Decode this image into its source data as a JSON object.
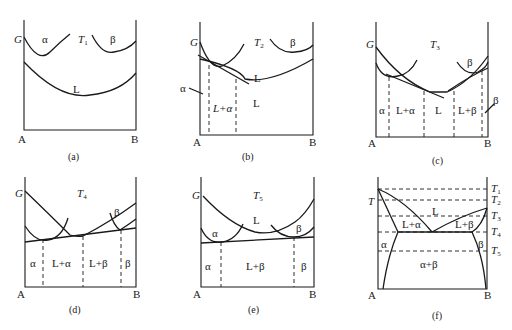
{
  "figure": {
    "colors": {
      "ink": "#1a1a1a",
      "background": "#ffffff"
    }
  },
  "panels": {
    "a": {
      "caption": "(a)",
      "axis_label": "G",
      "temp": "T",
      "temp_sub": "1",
      "left": "A",
      "right": "B",
      "curve_labels": {
        "alpha": "α",
        "beta": "β",
        "liquid": "L"
      }
    },
    "b": {
      "caption": "(b)",
      "axis_label": "G",
      "temp": "T",
      "temp_sub": "2",
      "left": "A",
      "right": "B",
      "curve_labels": {
        "beta": "β",
        "liquid": "L",
        "alpha": "α"
      },
      "regions": [
        "L+α",
        "L"
      ]
    },
    "c": {
      "caption": "(c)",
      "axis_label": "G",
      "temp": "T",
      "temp_sub": "3",
      "left": "A",
      "right": "B",
      "curve_labels": {
        "beta": "β",
        "beta_pointer": "β"
      },
      "regions": [
        "α",
        "L+α",
        "L",
        "L+β"
      ]
    },
    "d": {
      "caption": "(d)",
      "axis_label": "G",
      "temp": "T",
      "temp_sub": "4",
      "left": "A",
      "right": "B",
      "curve_labels": {
        "beta": "β"
      },
      "regions": [
        "α",
        "L+α",
        "L+β",
        "β"
      ]
    },
    "e": {
      "caption": "(e)",
      "axis_label": "G",
      "temp": "T",
      "temp_sub": "5",
      "left": "A",
      "right": "B",
      "curve_labels": {
        "alpha": "α",
        "liquid": "L",
        "beta": "β"
      },
      "regions": [
        "α",
        "L+β",
        "β"
      ]
    },
    "f": {
      "caption": "(f)",
      "axis_label": "T",
      "left": "A",
      "right": "B",
      "temps": [
        {
          "t": "T",
          "sub": "1"
        },
        {
          "t": "T",
          "sub": "2"
        },
        {
          "t": "T",
          "sub": "3"
        },
        {
          "t": "T",
          "sub": "4"
        },
        {
          "t": "T",
          "sub": "5"
        }
      ],
      "regions": [
        "L",
        "L+α",
        "L+β",
        "α",
        "β",
        "α+β"
      ]
    }
  }
}
